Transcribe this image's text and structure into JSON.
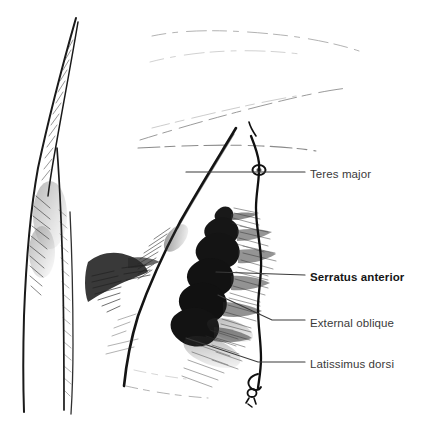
{
  "figure": {
    "background_color": "#ffffff",
    "ink_color": "#1a1a1a",
    "label_color": "#3a3a3a",
    "emphasis_color": "#151515",
    "width": 427,
    "height": 431
  },
  "labels": [
    {
      "id": "teres-major",
      "text": "Teres major",
      "emphasis": "normal",
      "x": 310,
      "y": 169
    },
    {
      "id": "serratus-anterior",
      "text": "Serratus anterior",
      "emphasis": "bold",
      "x": 310,
      "y": 272
    },
    {
      "id": "external-oblique",
      "text": "External oblique",
      "emphasis": "normal",
      "x": 310,
      "y": 318
    },
    {
      "id": "latissimus-dorsi",
      "text": "Latissimus dorsi",
      "emphasis": "normal",
      "x": 310,
      "y": 359
    }
  ],
  "markers": {
    "ring_marker": "ring-marker",
    "knot_marker": "knot-marker",
    "plumb_line": "plumb-line"
  },
  "structures": [
    "upper-arm-contour",
    "axillary-shadow",
    "latissimus-border",
    "serratus-digitations",
    "external-oblique-hatching",
    "scapular-sketch-lines"
  ]
}
